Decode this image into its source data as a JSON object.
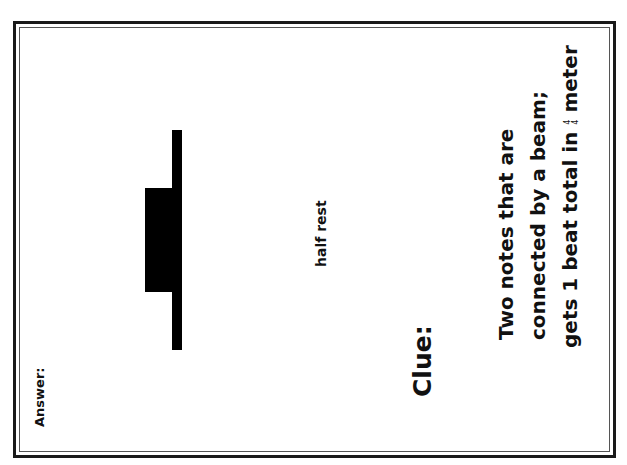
{
  "card": {
    "answer_label": "Answer:",
    "symbol_name": "half-rest",
    "symbol_caption": "half rest",
    "clue_label": "Clue:",
    "clue_lines": [
      "Two notes that are",
      "connected by a beam;",
      "gets 1 beat total in"
    ],
    "time_signature": {
      "top": "4",
      "bottom": "4"
    },
    "clue_tail": "meter"
  }
}
